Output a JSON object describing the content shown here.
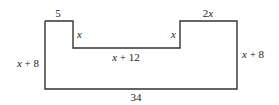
{
  "diagram": {
    "type": "composite-rectilinear-shape",
    "stroke_color": "#333333",
    "labels": {
      "top_left": "5",
      "left_notch_side": "x",
      "left_side": "x + 8",
      "notch_bottom": "x + 12",
      "right_notch_side": "x",
      "top_right": "2x",
      "right_side": "x + 8",
      "bottom": "34"
    }
  }
}
